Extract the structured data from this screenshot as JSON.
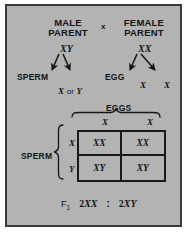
{
  "diagram": {
    "title_concept": "sex-determination-punnett-square",
    "parents": {
      "male": {
        "label_line1": "MALE",
        "label_line2": "PARENT",
        "genotype": "XY"
      },
      "cross_symbol": "x",
      "female": {
        "label_line1": "FEMALE",
        "label_line2": "PARENT",
        "genotype": "XX"
      }
    },
    "gametes": {
      "sperm_label": "SPERM",
      "sperm_types": "X or Y",
      "sperm_x": "X",
      "sperm_or": "or",
      "sperm_y": "Y",
      "egg_label": "EGG",
      "egg_1": "X",
      "egg_2": "X"
    },
    "punnett": {
      "column_group_label": "EGGS",
      "row_group_label": "SPERM",
      "column_headers": [
        "X",
        "X"
      ],
      "row_headers": [
        "X",
        "Y"
      ],
      "cells": [
        [
          "XX",
          "XX"
        ],
        [
          "XY",
          "XY"
        ]
      ]
    },
    "result": {
      "generation_label": "F",
      "generation_subscript": "1",
      "term_1": "2XX",
      "separator": ":",
      "term_2": "2XY"
    },
    "colors": {
      "panel_background": "#b3b3b3",
      "panel_border": "#3a3a3a",
      "ink": "#141414",
      "grid_line": "#191919",
      "page_background": "#ffffff"
    }
  }
}
